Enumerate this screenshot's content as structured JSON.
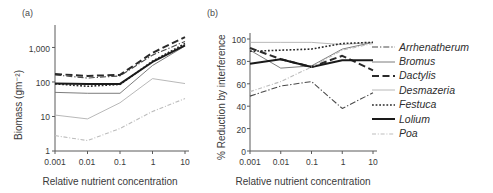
{
  "figure": {
    "panels": [
      {
        "tag": "(a)",
        "xlabel": "Relative nutrient concentration",
        "ylabel": "Biomass (gm⁻²)"
      },
      {
        "tag": "(b)",
        "xlabel": "Relative nutrient concentration",
        "ylabel": "% Reduction by interference"
      }
    ]
  },
  "legend": {
    "items": [
      {
        "label": "Arrhenatherum",
        "style": "dash-dot",
        "color": "#4a4a4a",
        "width": 1.1
      },
      {
        "label": "Bromus",
        "style": "solid",
        "color": "#6e6e6e",
        "width": 0.9
      },
      {
        "label": "Dactylis",
        "style": "long-dash",
        "color": "#2a2a2a",
        "width": 2.0
      },
      {
        "label": "Desmazeria",
        "style": "solid",
        "color": "#b0b0b0",
        "width": 0.9
      },
      {
        "label": "Festuca",
        "style": "dotted",
        "color": "#2a2a2a",
        "width": 1.6
      },
      {
        "label": "Lolium",
        "style": "solid",
        "color": "#1a1a1a",
        "width": 2.0
      },
      {
        "label": "Poa",
        "style": "dash-dot-light",
        "color": "#bdbdbd",
        "width": 1.1
      }
    ]
  },
  "chart_data": [
    {
      "type": "line",
      "title": "(a)",
      "xlabel": "Relative nutrient concentration",
      "ylabel": "Biomass (gm⁻²)",
      "xscale": "log",
      "yscale": "log",
      "x": [
        0.001,
        0.01,
        0.1,
        1,
        10
      ],
      "xticklabels": [
        "0.001",
        "0.01",
        "0.1",
        "1",
        "10"
      ],
      "yticks": [
        1,
        10,
        100,
        1000
      ],
      "yticklabels": [
        "1",
        "10",
        "100",
        "1,000"
      ],
      "ylim": [
        1,
        3000
      ],
      "xlim": [
        0.001,
        10
      ],
      "grid": false,
      "series": [
        {
          "name": "Arrhenatherum",
          "values": [
            160,
            130,
            150,
            600,
            1500
          ]
        },
        {
          "name": "Bromus",
          "values": [
            50,
            47,
            47,
            300,
            1100
          ]
        },
        {
          "name": "Dactylis",
          "values": [
            170,
            150,
            160,
            700,
            2000
          ]
        },
        {
          "name": "Desmazeria",
          "values": [
            11,
            8.5,
            25,
            125,
            90
          ]
        },
        {
          "name": "Festuca",
          "values": [
            88,
            75,
            85,
            400,
            1300
          ]
        },
        {
          "name": "Lolium",
          "values": [
            90,
            88,
            88,
            380,
            1150
          ]
        },
        {
          "name": "Poa",
          "values": [
            2.8,
            2.0,
            4.5,
            14,
            33
          ]
        }
      ]
    },
    {
      "type": "line",
      "title": "(b)",
      "xlabel": "Relative nutrient concentration",
      "ylabel": "% Reduction by interference",
      "xscale": "log",
      "yscale": "linear",
      "x": [
        0.001,
        0.01,
        0.1,
        1,
        10
      ],
      "xticklabels": [
        "0.001",
        "0.01",
        "0.1",
        "1",
        "10"
      ],
      "yticks": [
        0,
        20,
        40,
        60,
        80,
        100
      ],
      "yticklabels": [
        "0",
        "20",
        "40",
        "60",
        "80",
        "100"
      ],
      "ylim": [
        0,
        100
      ],
      "xlim": [
        0.001,
        10
      ],
      "grid": false,
      "series": [
        {
          "name": "Arrhenatherum",
          "values": [
            49,
            58,
            62,
            38,
            52
          ]
        },
        {
          "name": "Bromus",
          "values": [
            90,
            74,
            76,
            91,
            97
          ]
        },
        {
          "name": "Dactylis",
          "values": [
            92,
            82,
            75,
            85,
            72
          ]
        },
        {
          "name": "Desmazeria",
          "values": [
            97,
            97,
            97,
            95,
            97
          ]
        },
        {
          "name": "Festuca",
          "values": [
            89,
            90,
            91,
            96,
            97
          ]
        },
        {
          "name": "Lolium",
          "values": [
            78,
            82,
            75,
            81,
            81
          ]
        },
        {
          "name": "Poa",
          "values": [
            53,
            62,
            75,
            90,
            96
          ]
        }
      ]
    }
  ]
}
